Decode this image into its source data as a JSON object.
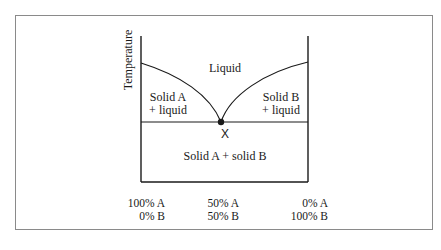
{
  "diagram": {
    "type": "eutectic phase diagram",
    "y_axis_label": "Temperature",
    "regions": {
      "liquid": "Liquid",
      "solid_a_liquid_line1": "Solid A",
      "solid_a_liquid_line2": "+ liquid",
      "solid_b_liquid_line1": "Solid B",
      "solid_b_liquid_line2": "+ liquid",
      "solid_solid": "Solid A + solid B"
    },
    "eutectic_marker": "X",
    "x_axis": {
      "left": {
        "line1": "100% A",
        "line2": "0% B"
      },
      "middle": {
        "line1": "50% A",
        "line2": "50% B"
      },
      "right": {
        "line1": "0% A",
        "line2": "100% B"
      }
    },
    "colors": {
      "line": "#1a1a1a",
      "frame": "#8a8a8a",
      "background": "#ffffff"
    }
  }
}
